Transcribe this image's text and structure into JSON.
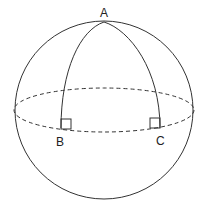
{
  "diagram": {
    "labels": {
      "A": "A",
      "B": "B",
      "C": "C"
    },
    "stroke_color": "#333333",
    "background": "#ffffff"
  }
}
